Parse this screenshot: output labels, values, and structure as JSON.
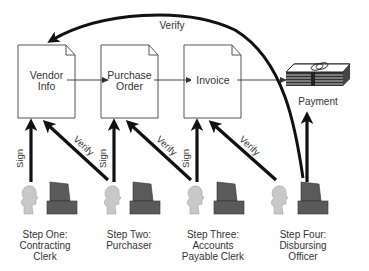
{
  "diagram": {
    "type": "process-flow",
    "colors": {
      "arrow": "#111111",
      "doc_border": "#555555",
      "person": "#c8c8c8",
      "computer": "#5a5a5a",
      "text": "#333333"
    },
    "documents": [
      {
        "id": "vendor-info",
        "label_line1": "Vendor",
        "label_line2": "Info"
      },
      {
        "id": "purchase-order",
        "label_line1": "Purchase",
        "label_line2": "Order"
      },
      {
        "id": "invoice",
        "label_line1": "Invoice",
        "label_line2": ""
      }
    ],
    "payment": {
      "label": "Payment",
      "icon": "money-stack-icon"
    },
    "steps": [
      {
        "line1": "Step One:",
        "line2": "Contracting",
        "line3": "Clerk"
      },
      {
        "line1": "Step Two:",
        "line2": "Purchaser",
        "line3": ""
      },
      {
        "line1": "Step Three:",
        "line2": "Accounts",
        "line3": "Payable Clerk"
      },
      {
        "line1": "Step Four:",
        "line2": "Disbursing",
        "line3": "Officer"
      }
    ],
    "arrow_labels": {
      "sign": "Sign",
      "verify": "Verify",
      "top_verify": "Verify"
    },
    "edges": [
      {
        "from": "vendor-info",
        "to": "purchase-order",
        "type": "thin"
      },
      {
        "from": "purchase-order",
        "to": "invoice",
        "type": "thin"
      },
      {
        "from": "invoice",
        "to": "payment",
        "type": "thin"
      },
      {
        "from": "step-1",
        "to": "vendor-info",
        "label": "Sign"
      },
      {
        "from": "step-2",
        "to": "vendor-info",
        "label": "Verify"
      },
      {
        "from": "step-2",
        "to": "purchase-order",
        "label": "Sign"
      },
      {
        "from": "step-3",
        "to": "purchase-order",
        "label": "Verify"
      },
      {
        "from": "step-3",
        "to": "invoice",
        "label": "Sign"
      },
      {
        "from": "step-4",
        "to": "invoice",
        "label": "Verify"
      },
      {
        "from": "step-4",
        "to": "payment",
        "label": ""
      },
      {
        "from": "step-4",
        "to": "vendor-info",
        "label": "Verify",
        "curved": true
      }
    ]
  }
}
